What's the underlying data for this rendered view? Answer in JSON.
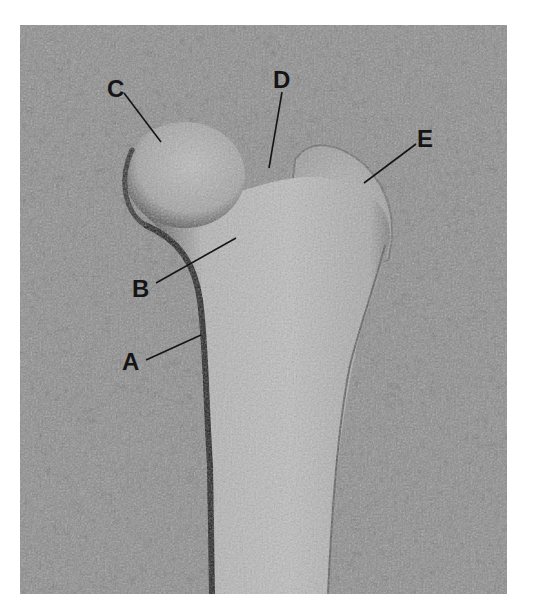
{
  "figure": {
    "labels": [
      {
        "id": "A",
        "text": "A"
      },
      {
        "id": "B",
        "text": "B"
      },
      {
        "id": "C",
        "text": "C"
      },
      {
        "id": "D",
        "text": "D"
      },
      {
        "id": "E",
        "text": "E"
      }
    ]
  }
}
